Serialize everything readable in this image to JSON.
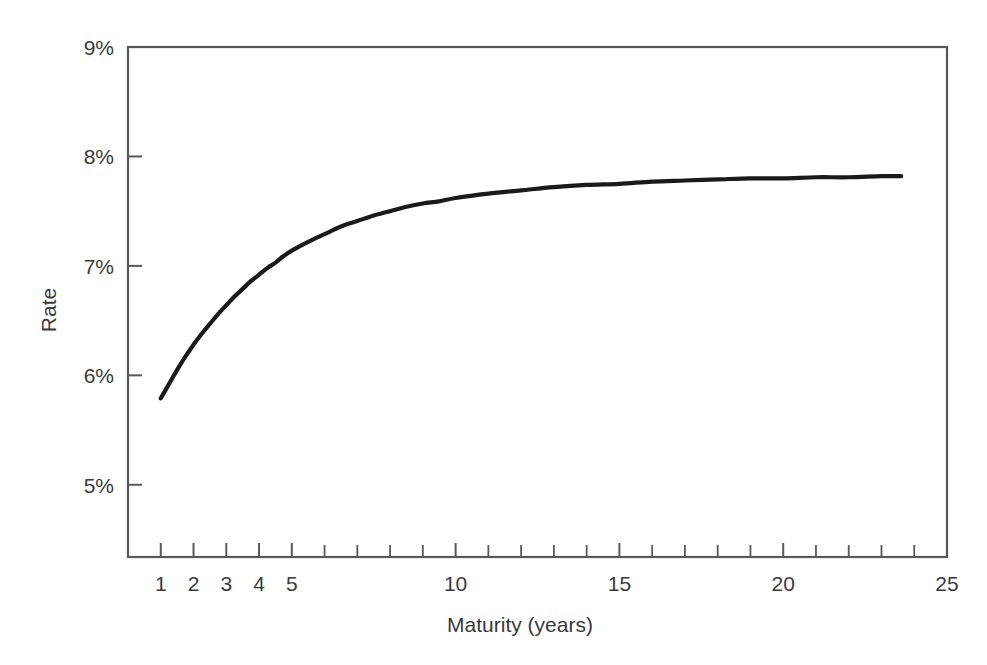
{
  "chart_data": {
    "type": "line",
    "title": "",
    "subtitle": "",
    "xlabel": "Maturity (years)",
    "ylabel": "Rate",
    "xlim": [
      0,
      25
    ],
    "ylim": [
      4.34,
      9.0
    ],
    "grid": false,
    "legend": null,
    "x_tick_values": [
      0,
      1,
      2,
      3,
      4,
      5,
      6,
      7,
      8,
      9,
      10,
      11,
      12,
      13,
      14,
      15,
      16,
      17,
      18,
      19,
      20,
      21,
      22,
      23,
      24,
      25
    ],
    "x_tick_labels": [
      {
        "value": 1,
        "label": "1"
      },
      {
        "value": 2,
        "label": "2"
      },
      {
        "value": 3,
        "label": "3"
      },
      {
        "value": 4,
        "label": "4"
      },
      {
        "value": 5,
        "label": "5"
      },
      {
        "value": 10,
        "label": "10"
      },
      {
        "value": 15,
        "label": "15"
      },
      {
        "value": 20,
        "label": "20"
      },
      {
        "value": 25,
        "label": "25"
      }
    ],
    "y_tick_values": [
      5,
      6,
      7,
      8,
      9
    ],
    "y_tick_labels": [
      "5%",
      "6%",
      "7%",
      "8%",
      "9%"
    ],
    "series": [
      {
        "name": "Yield curve",
        "color": "#1a1a1a",
        "x": [
          1.0,
          1.25,
          1.5,
          1.75,
          2.0,
          2.25,
          2.5,
          2.75,
          3.0,
          3.25,
          3.5,
          3.75,
          4.0,
          4.25,
          4.5,
          4.75,
          5.0,
          5.5,
          6.0,
          6.5,
          7.0,
          7.5,
          8.0,
          8.5,
          9.0,
          9.5,
          10.0,
          11.0,
          12.0,
          13.0,
          14.0,
          15.0,
          16.0,
          17.0,
          18.0,
          19.0,
          20.0,
          21.0,
          22.0,
          23.0,
          23.6
        ],
        "y": [
          5.79,
          5.92,
          6.05,
          6.17,
          6.28,
          6.38,
          6.47,
          6.56,
          6.64,
          6.72,
          6.79,
          6.86,
          6.92,
          6.98,
          7.03,
          7.09,
          7.14,
          7.22,
          7.29,
          7.36,
          7.41,
          7.46,
          7.5,
          7.54,
          7.57,
          7.59,
          7.62,
          7.66,
          7.69,
          7.72,
          7.74,
          7.75,
          7.77,
          7.78,
          7.79,
          7.8,
          7.8,
          7.81,
          7.81,
          7.82,
          7.82
        ]
      }
    ]
  },
  "axes": {
    "y_axis_title": "Rate",
    "x_axis_title": "Maturity (years)"
  }
}
